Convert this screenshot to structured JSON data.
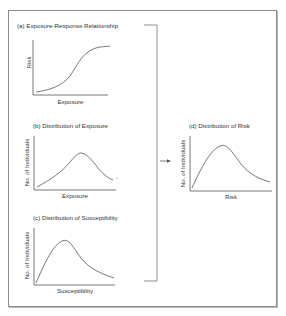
{
  "diagram": {
    "panels": [
      {
        "id": "a",
        "title": "(a) Exposure-Response Relationship",
        "xlabel": "Exposure",
        "ylabel": "Risk",
        "curve": "sigmoid increasing"
      },
      {
        "id": "b",
        "title": "(b) Distribution of Exposure",
        "xlabel": "Exposure",
        "ylabel": "No. of Individuals",
        "curve": "bell-shaped, peak right of center"
      },
      {
        "id": "c",
        "title": "(c) Distribution of Susceptibility",
        "xlabel": "Susceptibility",
        "ylabel": "No. of Individuals",
        "curve": "right-skewed"
      },
      {
        "id": "d",
        "title": "(d) Distribution of Risk",
        "xlabel": "Risk",
        "ylabel": "No. of Individuals",
        "curve": "right-skewed"
      }
    ],
    "connector": {
      "type": "bracket-arrow",
      "from": [
        "a",
        "b",
        "c"
      ],
      "to": "d"
    },
    "colors": {
      "line": "#555555",
      "frame": "#8a8a8a",
      "text": "#333333"
    }
  }
}
